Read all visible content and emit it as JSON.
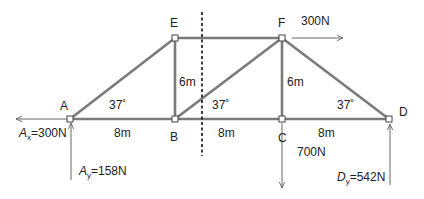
{
  "colors": {
    "member": "#7a7a7a",
    "force": "#666666",
    "node_fill": "#ffffff",
    "node_stroke": "#444444",
    "text": "#222222",
    "cut_line": "#111111"
  },
  "nodes": {
    "A": {
      "label": "A",
      "x": 70,
      "y": 119
    },
    "B": {
      "label": "B",
      "x": 175,
      "y": 119
    },
    "C": {
      "label": "C",
      "x": 282,
      "y": 119
    },
    "D": {
      "label": "D",
      "x": 389,
      "y": 119
    },
    "E": {
      "label": "E",
      "x": 175,
      "y": 38
    },
    "F": {
      "label": "F",
      "x": 282,
      "y": 38
    }
  },
  "members": [
    [
      "A",
      "B"
    ],
    [
      "B",
      "C"
    ],
    [
      "C",
      "D"
    ],
    [
      "E",
      "F"
    ],
    [
      "A",
      "E"
    ],
    [
      "E",
      "B"
    ],
    [
      "B",
      "F"
    ],
    [
      "F",
      "C"
    ],
    [
      "F",
      "D"
    ]
  ],
  "dimensions": {
    "AB": "8m",
    "BC": "8m",
    "CD": "8m",
    "EB_height": "6m",
    "FC_height": "6m"
  },
  "angles": {
    "at_A": "37˚",
    "at_B": "37˚",
    "at_D": "37˚"
  },
  "loads": {
    "F_horizontal": "300N",
    "C_vertical": "700N"
  },
  "reactions": {
    "Ax": {
      "symbol": "A",
      "sub": "x",
      "value": "=300N"
    },
    "Ay": {
      "symbol": "A",
      "sub": "y",
      "value": "=158N"
    },
    "Dy": {
      "symbol": "D",
      "sub": "y",
      "value": "=542N"
    }
  },
  "section_cut": {
    "x": 202,
    "y1": 12,
    "y2": 156
  }
}
